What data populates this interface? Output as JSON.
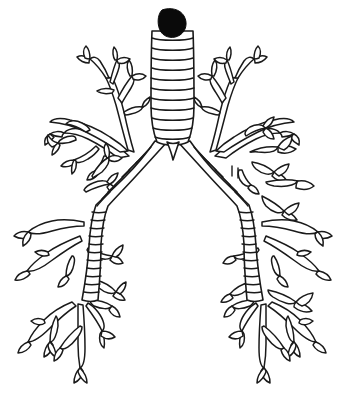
{
  "figure": {
    "name": "bronchial-tree-diagram",
    "style": "black-and-white line drawing",
    "background_color": "#ffffff",
    "line_color": "#1a1a1a",
    "canvas": {
      "width": 347,
      "height": 402
    }
  },
  "anatomy": {
    "obstruction": {
      "label": "obstruction-mass",
      "color": "#0a0a0a",
      "center_x": 172,
      "center_y": 22,
      "width": 26,
      "height": 24
    },
    "trachea": {
      "label": "trachea",
      "top_y": 30,
      "bottom_y": 138,
      "left_x": 152,
      "right_x": 193,
      "ring_count": 11,
      "ring_ys": [
        38,
        48,
        58,
        68,
        78,
        88,
        98,
        108,
        118,
        128,
        136
      ]
    },
    "carina": {
      "label": "carina",
      "x": 172,
      "y": 160
    },
    "left_main_bronchus": {
      "label": "left-main-bronchus",
      "ring_count": 8,
      "start": [
        152,
        142
      ],
      "end": [
        92,
        205
      ]
    },
    "right_main_bronchus": {
      "label": "right-main-bronchus",
      "ring_count": 8,
      "start": [
        193,
        142
      ],
      "end": [
        252,
        205
      ]
    },
    "left_lower_bronchus": {
      "label": "left-lower-lobe-bronchus",
      "ring_count": 12,
      "start": [
        92,
        205
      ],
      "end": [
        78,
        300
      ]
    },
    "right_lower_bronchus": {
      "label": "right-lower-lobe-bronchus",
      "ring_count": 14,
      "start": [
        252,
        205
      ],
      "end": [
        262,
        305
      ]
    },
    "lobes": [
      {
        "label": "left-upper-lobe-branches",
        "side": "left",
        "region": "upper"
      },
      {
        "label": "left-middle-lobe-branches",
        "side": "left",
        "region": "middle"
      },
      {
        "label": "left-lower-lobe-branches",
        "side": "left",
        "region": "lower"
      },
      {
        "label": "right-upper-lobe-branches",
        "side": "right",
        "region": "upper"
      },
      {
        "label": "right-middle-lobe-branches",
        "side": "right",
        "region": "middle"
      },
      {
        "label": "right-lower-lobe-branches",
        "side": "right",
        "region": "lower"
      }
    ]
  }
}
